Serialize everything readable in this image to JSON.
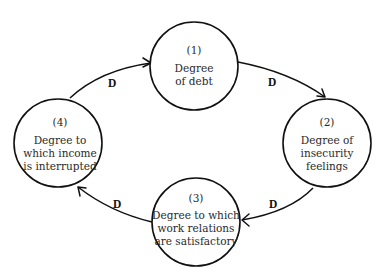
{
  "diagram": {
    "type": "causal-cycle",
    "nodes": [
      {
        "id": "1",
        "number": "(1)",
        "lines": [
          "Degree",
          "of debt"
        ],
        "cx": 194,
        "cy": 66,
        "r": 44
      },
      {
        "id": "2",
        "number": "(2)",
        "lines": [
          "Degree of",
          "insecurity",
          "feelings"
        ],
        "cx": 327,
        "cy": 143,
        "r": 44
      },
      {
        "id": "3",
        "number": "(3)",
        "lines": [
          "Degree to which",
          "work relations",
          "are satisfactory"
        ],
        "cx": 196,
        "cy": 222,
        "r": 44
      },
      {
        "id": "4",
        "number": "(4)",
        "lines": [
          "Degree to",
          "which income",
          "is interrupted"
        ],
        "cx": 58,
        "cy": 143,
        "r": 44
      }
    ],
    "edges": [
      {
        "from": "4",
        "to": "1",
        "label": "D"
      },
      {
        "from": "1",
        "to": "2",
        "label": "D"
      },
      {
        "from": "2",
        "to": "3",
        "label": "D"
      },
      {
        "from": "3",
        "to": "4",
        "label": "D"
      }
    ]
  }
}
